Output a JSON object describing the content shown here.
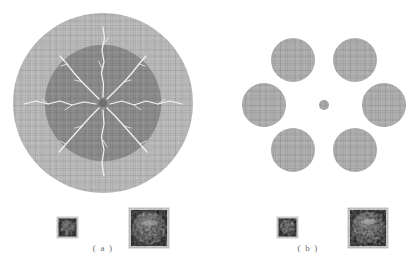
{
  "figure": {
    "background_color": "#ffffff",
    "panels": [
      {
        "id": "a",
        "caption": "( a )",
        "type": "single-large-crater",
        "center": [
          103,
          103
        ],
        "outer_circle": {
          "radius": 90,
          "color": "#b8b8b8"
        },
        "inner_circle": {
          "radius": 58,
          "color": "#8a8a8a"
        },
        "center_dot": {
          "radius": 4,
          "color": "#6f6f6f"
        },
        "crack_color": "#f0f0f0",
        "crack_count": 8,
        "crack_directions_deg": [
          270,
          315,
          0,
          45,
          90,
          135,
          180,
          225
        ]
      },
      {
        "id": "b",
        "caption": "( b )",
        "type": "hexagonal-crater-array",
        "center": [
          324,
          105
        ],
        "center_dot": {
          "radius": 5,
          "color": "#a8a8a8"
        },
        "satellite_radius": 22,
        "satellite_color": "#adadad",
        "satellites": [
          {
            "label": "top-left",
            "cx": 293,
            "cy": 60
          },
          {
            "label": "top-right",
            "cx": 355,
            "cy": 60
          },
          {
            "label": "middle-left",
            "cx": 264,
            "cy": 105
          },
          {
            "label": "middle-right",
            "cx": 384,
            "cy": 105
          },
          {
            "label": "bottom-left",
            "cx": 293,
            "cy": 150
          },
          {
            "label": "bottom-right",
            "cx": 355,
            "cy": 150
          }
        ]
      }
    ],
    "thumbnails": [
      {
        "panel": "a",
        "size": "small",
        "x": 57,
        "y": 217,
        "w": 21,
        "h": 21,
        "description": "dark mottled circular specimen"
      },
      {
        "panel": "a",
        "size": "large",
        "x": 129,
        "y": 208,
        "w": 40,
        "h": 40,
        "description": "dark mottled circular specimen"
      },
      {
        "panel": "b",
        "size": "small",
        "x": 277,
        "y": 217,
        "w": 21,
        "h": 21,
        "description": "dark mottled circular specimen"
      },
      {
        "panel": "b",
        "size": "large",
        "x": 348,
        "y": 208,
        "w": 40,
        "h": 40,
        "description": "dark mottled circular specimen"
      }
    ]
  }
}
